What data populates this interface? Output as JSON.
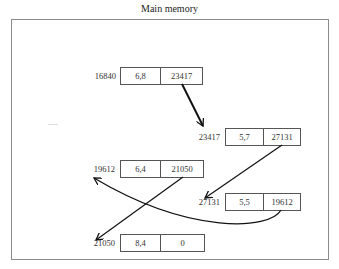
{
  "title": "Main memory",
  "nodes": [
    {
      "address": "16840",
      "data": "6,8",
      "next": "23417"
    },
    {
      "address": "23417",
      "data": "5,7",
      "next": "27131"
    },
    {
      "address": "19612",
      "data": "6,4",
      "next": "21050"
    },
    {
      "address": "27131",
      "data": "5,5",
      "next": "19612"
    },
    {
      "address": "21050",
      "data": "8,4",
      "next": "0"
    }
  ],
  "links": [
    {
      "from": "16840",
      "to": "23417"
    },
    {
      "from": "23417",
      "to": "27131"
    },
    {
      "from": "27131",
      "to": "19612"
    },
    {
      "from": "19612",
      "to": "21050"
    }
  ],
  "colors": {
    "line": "#111111",
    "frame": "#8a8a8a",
    "box": "#555555"
  }
}
